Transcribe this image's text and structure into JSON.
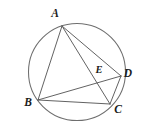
{
  "figure": {
    "background_color": "#ffffff",
    "stroke_color": "#5a5a5a",
    "circle_stroke_color": "#6e6e6e",
    "label_color": "#1c1c1c"
  },
  "circle": {
    "name": "circumscribed-circle",
    "cx": 77,
    "cy": 72,
    "r": 48.5
  },
  "points": [
    {
      "id": "A",
      "label": "A",
      "x": 62,
      "y": 26,
      "label_x": 55,
      "label_y": 14,
      "on_circle": true
    },
    {
      "id": "B",
      "label": "B",
      "x": 38,
      "y": 100,
      "label_x": 28,
      "label_y": 103,
      "on_circle": true
    },
    {
      "id": "C",
      "label": "C",
      "x": 110,
      "y": 104,
      "label_x": 118,
      "label_y": 110,
      "on_circle": true
    },
    {
      "id": "D",
      "label": "D",
      "x": 121,
      "y": 76,
      "label_x": 128,
      "label_y": 74,
      "on_circle": true
    },
    {
      "id": "E",
      "label": "E",
      "x": 97,
      "y": 79,
      "label_x": 99,
      "label_y": 71,
      "on_circle": false
    }
  ],
  "segments": [
    {
      "id": "AB",
      "from": "A",
      "to": "B",
      "name": "segment-ab"
    },
    {
      "id": "AD",
      "from": "A",
      "to": "D",
      "name": "segment-ad"
    },
    {
      "id": "AC",
      "from": "A",
      "to": "C",
      "name": "segment-ac-diagonal"
    },
    {
      "id": "BD",
      "from": "B",
      "to": "D",
      "name": "segment-bd-diagonal"
    },
    {
      "id": "BC",
      "from": "B",
      "to": "C",
      "name": "segment-bc"
    },
    {
      "id": "CD",
      "from": "C",
      "to": "D",
      "name": "segment-cd"
    }
  ]
}
